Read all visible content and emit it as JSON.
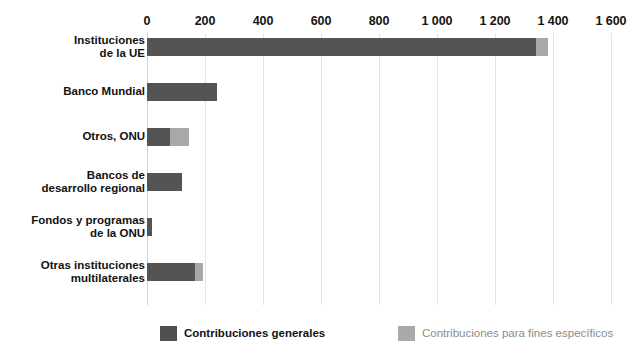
{
  "chart_data": {
    "type": "bar",
    "orientation": "horizontal",
    "stacked": true,
    "title": "",
    "subtitle": "",
    "xlabel": "",
    "ylabel": "",
    "xlim": [
      0,
      1600
    ],
    "grid": true,
    "legend_position": "bottom",
    "categories": [
      "Instituciones\nde la UE",
      "Banco Mundial",
      "Otros, ONU",
      "Bancos de\ndesarrollo regional",
      "Fondos y programas\nde la ONU",
      "Otras instituciones\nmultilaterales"
    ],
    "tick_labels": [
      "0",
      "200",
      "400",
      "600",
      "800",
      "1 000",
      "1 200",
      "1 400",
      "1 600"
    ],
    "tick_values": [
      0,
      200,
      400,
      600,
      800,
      1000,
      1200,
      1400,
      1600
    ],
    "series": [
      {
        "name": "Contribuciones generales",
        "color": "#545454",
        "values": [
          1340,
          240,
          80,
          120,
          18,
          165
        ]
      },
      {
        "name": "Contribuciones para fines específicos",
        "color": "#a8a8a8",
        "values": [
          42,
          0,
          65,
          0,
          0,
          28
        ]
      }
    ]
  },
  "legend": {
    "items": [
      {
        "label": "Contribuciones generales",
        "swatch": "general"
      },
      {
        "label": "Contribuciones para fines específicos",
        "swatch": "specific"
      }
    ]
  },
  "colors": {
    "general": "#545454",
    "specific": "#a8a8a8",
    "gridline": "#e3e3e3",
    "background": "#ffffff",
    "text": "#141414",
    "legend_specific_text": "#8c8c8c"
  },
  "axis": {
    "origin_px": 147,
    "px_per_unit": 0.29,
    "row_height_px": 45,
    "row_top_px": 5,
    "bar_height_px": 18
  }
}
